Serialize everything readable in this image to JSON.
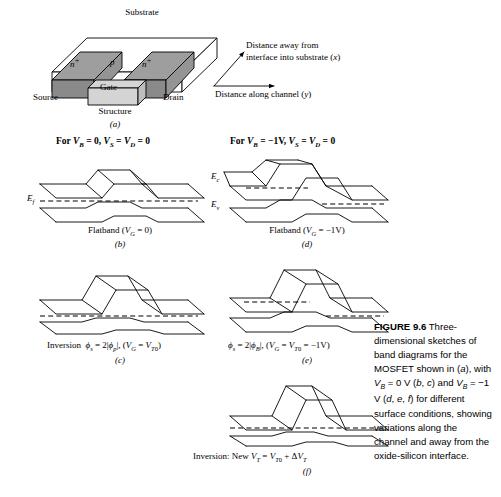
{
  "structure": {
    "substrate_label": "Substrate",
    "nplus_left": "n",
    "nplus_left_sup": "+",
    "nplus_right": "n",
    "nplus_right_sup": "+",
    "body_label": "p",
    "gate_label": "Gate",
    "source_label": "Source",
    "drain_label": "Drain",
    "title": "Structure",
    "panel_letter": "(a)"
  },
  "axes": {
    "x_axis_line1": "Distance away from",
    "x_axis_line2": "interface into substrate (x)",
    "y_axis": "Distance along channel (y)"
  },
  "headers": {
    "left": "For V_B = 0, V_S = V_D = 0",
    "right": "For V_B = −1V, V_S = V_D = 0"
  },
  "band_labels": {
    "ec": "E",
    "ec_sub": "c",
    "ev": "E",
    "ev_sub": "v",
    "ef": "E",
    "ef_sub": "f"
  },
  "panels": {
    "b": {
      "caption": "Flatband (V_G = 0)",
      "letter": "(b)"
    },
    "c": {
      "caption": "Inversion  φ_s = 2|φ_p|, (V_G = V_T0)",
      "letter": "(c)"
    },
    "d": {
      "caption": "Flatband (V_G = −1V)",
      "letter": "(d)"
    },
    "e": {
      "caption": "φ_s = 2|φ_B|, (V_G = V_T0 = −1V)",
      "letter": "(e)"
    },
    "f": {
      "caption": "Inversion: New V_T = V_T0 + ΔV_T",
      "letter": "(f)"
    }
  },
  "figure_caption": {
    "number": "FIGURE 9.6",
    "text": "Three-dimensional sketches of band diagrams for the MOSFET shown in (a), with VB = 0 V (b, c) and VB = −1 V (d, e, f) for different surface conditions, showing variations along the channel and away from the oxide-silicon interface."
  },
  "colors": {
    "nplus_top": "#9e9e9e",
    "nplus_side": "#8a8a8a",
    "gate_face": "#d4d4d4",
    "gate_side": "#bdbdbd",
    "substrate": "#ffffff",
    "line": "#000000"
  }
}
